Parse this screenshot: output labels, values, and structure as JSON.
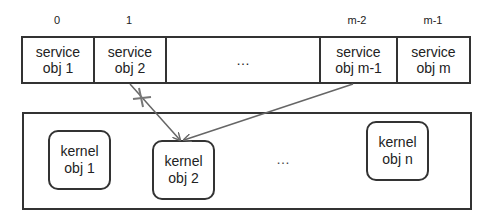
{
  "service_array": {
    "indices": [
      "0",
      "1",
      "m-2",
      "m-1"
    ],
    "cells": [
      {
        "line1": "service",
        "line2": "obj 1"
      },
      {
        "line1": "service",
        "line2": "obj 2"
      },
      {
        "ellipsis": "…"
      },
      {
        "line1": "service",
        "line2": "obj m-1"
      },
      {
        "line1": "service",
        "line2": "obj m"
      }
    ]
  },
  "kernel_space": {
    "objects": [
      {
        "line1": "kernel",
        "line2": "obj 1"
      },
      {
        "line1": "kernel",
        "line2": "obj 2"
      },
      {
        "line1": "kernel",
        "line2": "obj n"
      }
    ],
    "ellipsis": "…"
  },
  "arrows": [
    {
      "from": "service obj 2",
      "to": "kernel obj 2",
      "blocked": true
    },
    {
      "from": "service obj m-1",
      "to": "kernel obj 2",
      "blocked": false
    }
  ],
  "colors": {
    "line": "#333333",
    "arrow": "#666666"
  }
}
